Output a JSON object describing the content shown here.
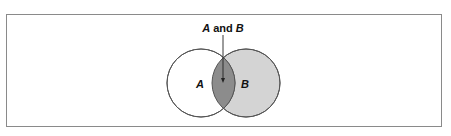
{
  "diagram": {
    "type": "venn",
    "sets": [
      {
        "id": "A",
        "label": "A",
        "fill": "#ffffff",
        "stroke": "#555555"
      },
      {
        "id": "B",
        "label": "B",
        "fill": "#d4d4d4",
        "stroke": "#555555"
      }
    ],
    "intersection": {
      "label_set1": "A",
      "label_connector": " and ",
      "label_set2": "B",
      "fill": "#8c8c8c"
    },
    "colors": {
      "border": "#8a8a8a",
      "background": "#ffffff",
      "text": "#111111"
    }
  }
}
